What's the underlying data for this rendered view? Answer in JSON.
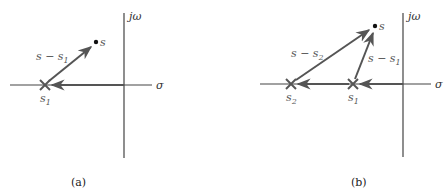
{
  "panels": [
    {
      "id": "a",
      "caption": "(a)",
      "axes": {
        "real_label": "σ",
        "imag_label": "jω"
      },
      "points": [
        {
          "label": "s",
          "kind": "point"
        }
      ],
      "poles": [
        {
          "label": "s",
          "sub": "1"
        }
      ],
      "vectors": [
        {
          "label": "s − s",
          "sub": "1"
        }
      ]
    },
    {
      "id": "b",
      "caption": "(b)",
      "axes": {
        "real_label": "σ",
        "imag_label": "jω"
      },
      "points": [
        {
          "label": "s",
          "kind": "point"
        }
      ],
      "poles": [
        {
          "label": "s",
          "sub": "2"
        },
        {
          "label": "s",
          "sub": "1"
        }
      ],
      "vectors": [
        {
          "label": "s − s",
          "sub": "2"
        },
        {
          "label": "s − s",
          "sub": "1"
        }
      ]
    }
  ],
  "colors": {
    "axis": "#444444",
    "vector": "#555555",
    "pole": "#555555",
    "text": "#555555"
  }
}
